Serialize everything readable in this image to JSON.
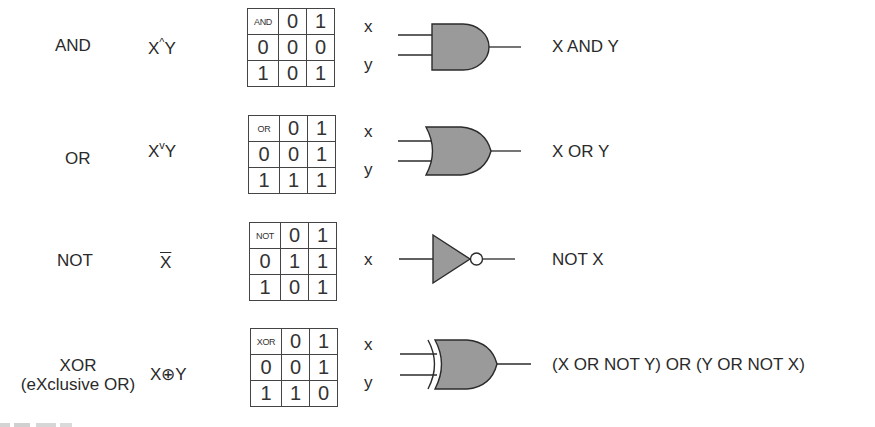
{
  "colors": {
    "gate_fill": "#9a9a9a",
    "stroke": "#2b2b2b",
    "text": "#2a2a2a",
    "background": "#ffffff"
  },
  "rows": [
    {
      "name": "AND",
      "subtitle": null,
      "expression": {
        "left": "X",
        "op": "^",
        "right": "Y"
      },
      "truth_table": {
        "header": [
          "AND",
          "0",
          "1"
        ],
        "rows": [
          [
            "0",
            "0",
            "0"
          ],
          [
            "1",
            "0",
            "1"
          ]
        ]
      },
      "inputs": [
        "x",
        "y"
      ],
      "gate_icon": "and-gate-icon",
      "result": "X AND Y"
    },
    {
      "name": "OR",
      "subtitle": null,
      "expression": {
        "left": "X",
        "op": "v",
        "right": "Y"
      },
      "truth_table": {
        "header": [
          "OR",
          "0",
          "1"
        ],
        "rows": [
          [
            "0",
            "0",
            "1"
          ],
          [
            "1",
            "1",
            "1"
          ]
        ]
      },
      "inputs": [
        "x",
        "y"
      ],
      "gate_icon": "or-gate-icon",
      "result": "X OR Y"
    },
    {
      "name": "NOT",
      "subtitle": null,
      "expression": {
        "left": "X",
        "op": "overline",
        "right": ""
      },
      "truth_table": {
        "header": [
          "NOT",
          "0",
          "1"
        ],
        "rows": [
          [
            "0",
            "1",
            "1"
          ],
          [
            "1",
            "0",
            "1"
          ]
        ]
      },
      "inputs": [
        "x"
      ],
      "gate_icon": "not-gate-icon",
      "result": "NOT X"
    },
    {
      "name": "XOR",
      "subtitle": "(eXclusive OR)",
      "expression": {
        "left": "X",
        "op": "⊕",
        "right": "Y"
      },
      "truth_table": {
        "header": [
          "XOR",
          "0",
          "1"
        ],
        "rows": [
          [
            "0",
            "0",
            "1"
          ],
          [
            "1",
            "1",
            "0"
          ]
        ]
      },
      "inputs": [
        "x",
        "y"
      ],
      "gate_icon": "xor-gate-icon",
      "result": "(X OR NOT Y) OR (Y OR NOT X)"
    }
  ]
}
